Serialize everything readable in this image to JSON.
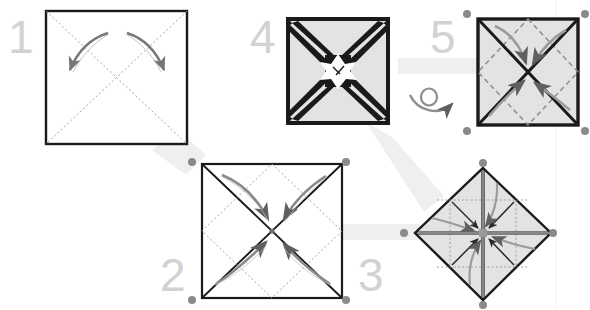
{
  "document": {
    "title": "Origami folding instructions",
    "background_color": "#ffffff",
    "width": 590,
    "height": 310
  },
  "palette": {
    "paper_white": "#ffffff",
    "paper_gray": "#e3e3e3",
    "outline_black": "#1a1a1a",
    "fold_line_gray": "#8d8d8d",
    "arrow_gray": "#777777",
    "number_gray": "#d2d2d2",
    "marker_gray": "#8a8a8a",
    "band_gray": "#eeeeee"
  },
  "steps": [
    {
      "id": "step-1",
      "number": "1",
      "figure": "square-with-diagonal-fold-lines",
      "fill": "#ffffff",
      "arrows": 2,
      "arrow_direction": "outward",
      "description": "Square sheet with dotted diagonal creases, two arrows fanning outward"
    },
    {
      "id": "step-2",
      "number": "2",
      "figure": "square-with-diagonals-and-inner-diamond",
      "fill": "#ffffff",
      "arrows": 4,
      "arrow_direction": "inward-to-center",
      "description": "Square with solid diagonals and dotted inner diamond, four corners folded to center"
    },
    {
      "id": "step-3",
      "number": "3",
      "figure": "diamond-with-cross-and-grid",
      "fill": "#e3e3e3",
      "arrows": 4,
      "arrow_direction": "inward-to-center",
      "description": "Rotated square with bold cross through centre and dotted grid, four points folded in"
    },
    {
      "id": "step-4",
      "number": "4",
      "figure": "square-with-thick-x-bands-and-star-center",
      "fill": "#e3e3e3",
      "arrows": 0,
      "arrow_direction": "none",
      "description": "Square with heavy tapering black bands meeting a white star shaped centre"
    },
    {
      "id": "step-5",
      "number": "5",
      "figure": "square-with-bold-diagonals-and-dashed-diamond",
      "fill": "#e3e3e3",
      "arrows": 4,
      "arrow_direction": "inward-to-center",
      "description": "Flipped square with bold diagonals, dashed diamond creases and four inward arrows"
    }
  ],
  "symbols": [
    {
      "id": "turn-over",
      "name": "turn-over-symbol",
      "label": "turn over",
      "between": "step-4 to step-5"
    }
  ],
  "flow_bands": [
    {
      "from": "step-1",
      "to": "step-2",
      "orientation": "diagonal"
    },
    {
      "from": "step-2",
      "to": "step-3",
      "orientation": "horizontal"
    },
    {
      "from": "step-4",
      "to": "step-3",
      "orientation": "diagonal"
    },
    {
      "from": "step-4",
      "to": "step-5",
      "orientation": "horizontal"
    }
  ],
  "selection_markers": {
    "name": "corner-handle-dots",
    "color": "#8a8a8a",
    "radius": 4,
    "points": [
      {
        "x": 467,
        "y": 14
      },
      {
        "x": 585,
        "y": 14
      },
      {
        "x": 467,
        "y": 131
      },
      {
        "x": 585,
        "y": 131
      },
      {
        "x": 192,
        "y": 162
      },
      {
        "x": 346,
        "y": 162
      },
      {
        "x": 192,
        "y": 300
      },
      {
        "x": 346,
        "y": 300
      },
      {
        "x": 404,
        "y": 233
      },
      {
        "x": 553,
        "y": 233
      },
      {
        "x": 483,
        "y": 163
      },
      {
        "x": 483,
        "y": 305
      }
    ]
  }
}
